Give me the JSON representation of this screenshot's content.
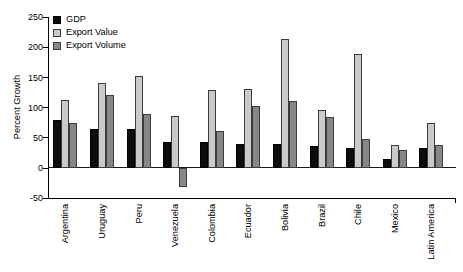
{
  "chart_data": {
    "type": "bar",
    "title": "",
    "ylabel": "Percent Growth",
    "xlabel": "",
    "ylim": [
      -50,
      250
    ],
    "yticks": [
      250,
      200,
      150,
      100,
      50,
      0,
      -50
    ],
    "grid": false,
    "legend_position": "top-left-inside",
    "categories": [
      "Argentina",
      "Uruguay",
      "Peru",
      "Venezuela",
      "Colombia",
      "Ecuador",
      "Bolivia",
      "Brazil",
      "Chile",
      "Mexico",
      "Latin America"
    ],
    "series": [
      {
        "name": "GDP",
        "color": "#0d0d0d",
        "values": [
          80,
          65,
          65,
          43,
          43,
          40,
          39,
          36,
          33,
          15,
          33
        ]
      },
      {
        "name": "Export Value",
        "color": "#cacaca",
        "values": [
          112,
          141,
          153,
          87,
          130,
          131,
          213,
          96,
          189,
          38,
          74
        ]
      },
      {
        "name": "Export Volume",
        "color": "#878787",
        "values": [
          74,
          121,
          89,
          -32,
          61,
          103,
          111,
          85,
          48,
          30,
          38
        ]
      }
    ],
    "colors": {
      "axis": "#000000",
      "bar_border": "#3c3c3c",
      "background": "#ffffff"
    }
  }
}
